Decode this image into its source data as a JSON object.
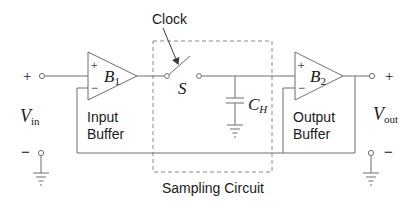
{
  "diagram": {
    "colors": {
      "line": "#6e6e6e",
      "text": "#1a1a1a",
      "dashed_box": "#8a8a8a"
    },
    "input": {
      "label_main": "V",
      "label_sub": "in",
      "plus": "+",
      "minus": "−"
    },
    "output": {
      "label_main": "V",
      "label_sub": "out",
      "plus": "+",
      "minus": "−"
    },
    "buffer1": {
      "label_main": "B",
      "label_sub": "1",
      "plus": "+",
      "minus": "−",
      "caption_line1": "Input",
      "caption_line2": "Buffer"
    },
    "buffer2": {
      "label_main": "B",
      "label_sub": "2",
      "plus": "+",
      "minus": "−",
      "caption_line1": "Output",
      "caption_line2": "Buffer"
    },
    "switch": {
      "label": "S",
      "control_label": "Clock"
    },
    "capacitor": {
      "label_main": "C",
      "label_sub": "H"
    },
    "sampling_block": {
      "label": "Sampling Circuit"
    }
  }
}
